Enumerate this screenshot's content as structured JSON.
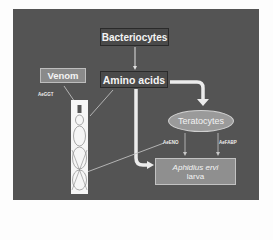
{
  "diagram": {
    "nodes": {
      "bacteriocytes": "Bacteriocytes",
      "amino_acids": "Amino acids",
      "venom": "Venom",
      "teratocytes": "Teratocytes",
      "larva_species": "Aphidius ervi",
      "larva_word": "larva"
    },
    "labels": {
      "ae_ggt": "AeGGT",
      "ae_eno": "AeENO",
      "ae_fabp": "AeFABP"
    },
    "edges": [
      {
        "from": "Bacteriocytes",
        "to": "Amino acids",
        "style": "thin"
      },
      {
        "from": "Amino acids",
        "to": "Teratocytes",
        "style": "thick"
      },
      {
        "from": "Amino acids",
        "to": "Aphidius ervi larva",
        "style": "thick"
      },
      {
        "from": "Teratocytes",
        "to": "Aphidius ervi larva",
        "label": "AeENO",
        "style": "thin"
      },
      {
        "from": "Teratocytes",
        "to": "Aphidius ervi larva",
        "label": "AeFABP",
        "style": "thin"
      },
      {
        "from": "Venom",
        "to": "host illustration",
        "label": "AeGGT",
        "style": "thin"
      },
      {
        "from": "Amino acids",
        "to": "host illustration",
        "style": "thin"
      },
      {
        "from": "AeENO",
        "to": "host illustration",
        "style": "thin"
      }
    ],
    "colors": {
      "background": "#545454",
      "dark_box": "#4a4a4a",
      "light_box": "#8f8f8f",
      "arrow": "#e8e8e8"
    }
  }
}
